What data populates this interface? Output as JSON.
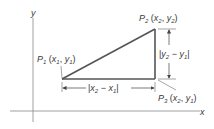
{
  "diagram": {
    "type": "distance-formula-right-triangle",
    "axes": {
      "x_label": "x",
      "y_label": "y"
    },
    "points": [
      {
        "id": "P1",
        "name": "P",
        "index": "1",
        "coords_x": "x",
        "coords_x_sub": "1",
        "coords_y": "y",
        "coords_y_sub": "1"
      },
      {
        "id": "P2",
        "name": "P",
        "index": "2",
        "coords_x": "x",
        "coords_x_sub": "2",
        "coords_y": "y",
        "coords_y_sub": "2"
      },
      {
        "id": "P3",
        "name": "P",
        "index": "3",
        "coords_x": "x",
        "coords_x_sub": "2",
        "coords_y": "y",
        "coords_y_sub": "1"
      }
    ],
    "dimensions": {
      "horizontal": {
        "a": "x",
        "a_sub": "2",
        "op": "−",
        "b": "x",
        "b_sub": "1"
      },
      "vertical": {
        "a": "y",
        "a_sub": "2",
        "op": "−",
        "b": "y",
        "b_sub": "1"
      }
    },
    "colors": {
      "triangle": "#555555",
      "axes": "#777777",
      "text": "#3a3a3a"
    }
  }
}
